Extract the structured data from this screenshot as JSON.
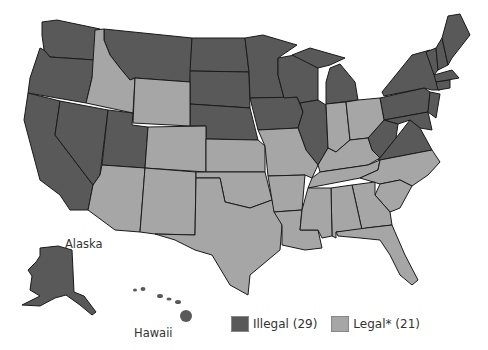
{
  "labels": {
    "alaska": "Alaska",
    "hawaii": "Hawaii"
  },
  "legend": {
    "items": [
      {
        "label": "Illegal (29)",
        "color": "#595959",
        "status": "illegal",
        "count": 29
      },
      {
        "label": "Legal* (21)",
        "color": "#a6a6a6",
        "status": "legal",
        "count": 21
      }
    ]
  },
  "colors": {
    "illegal": "#595959",
    "legal": "#a6a6a6",
    "border": "#1a1a1a",
    "background": "#ffffff"
  },
  "states": {
    "illegal": [
      "WA",
      "OR",
      "CA",
      "NV",
      "UT",
      "MT",
      "ND",
      "SD",
      "NE",
      "MN",
      "IA",
      "WI",
      "IL",
      "MI",
      "PA",
      "NY",
      "VT",
      "NH",
      "ME",
      "MA",
      "RI",
      "CT",
      "NJ",
      "DE",
      "MD",
      "WV",
      "VA",
      "AK",
      "HI"
    ],
    "legal": [
      "ID",
      "WY",
      "CO",
      "AZ",
      "NM",
      "KS",
      "OK",
      "TX",
      "MO",
      "AR",
      "LA",
      "IN",
      "OH",
      "KY",
      "TN",
      "MS",
      "AL",
      "GA",
      "FL",
      "SC",
      "NC"
    ]
  }
}
